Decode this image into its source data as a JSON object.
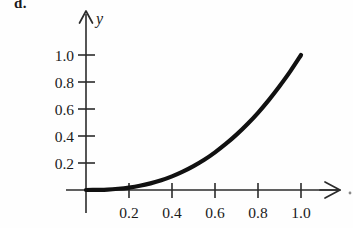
{
  "figure": {
    "problem_label": "d.",
    "background_color": "#fefefe",
    "ink_color": "#111111",
    "axis_color": "#2b2b2b"
  },
  "chart_data": {
    "type": "line",
    "title": "",
    "subtitle": "",
    "xlabel": "",
    "ylabel": "y",
    "x_axis_name": "",
    "y_axis_name": "y",
    "xlim": [
      0,
      1.2
    ],
    "ylim": [
      0,
      1.15
    ],
    "grid": false,
    "legend": false,
    "legend_position": "none",
    "xticks": [
      0.2,
      0.4,
      0.6,
      0.8,
      1.0
    ],
    "xtick_labels": [
      "0.2",
      "0.4",
      "0.6",
      "0.8",
      "1.0"
    ],
    "yticks": [
      0.2,
      0.4,
      0.6,
      0.8,
      1.0
    ],
    "ytick_labels": [
      "0.2",
      "0.4",
      "0.6",
      "0.8",
      "1.0"
    ],
    "annotations": [],
    "series": [
      {
        "name": "curve",
        "color": "#111111",
        "x": [
          0.0,
          0.05,
          0.1,
          0.15,
          0.2,
          0.25,
          0.3,
          0.35,
          0.4,
          0.45,
          0.5,
          0.55,
          0.6,
          0.65,
          0.7,
          0.75,
          0.8,
          0.85,
          0.9,
          0.95,
          1.0
        ],
        "values": [
          0.0,
          0.001,
          0.003,
          0.009,
          0.018,
          0.031,
          0.049,
          0.072,
          0.101,
          0.136,
          0.177,
          0.224,
          0.279,
          0.341,
          0.41,
          0.487,
          0.572,
          0.666,
          0.769,
          0.879,
          1.0
        ]
      }
    ]
  }
}
